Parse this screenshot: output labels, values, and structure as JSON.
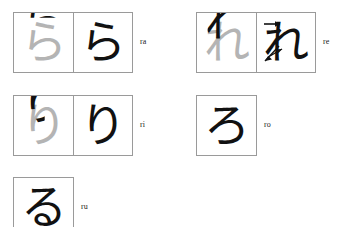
{
  "page": {
    "background_color": "#ffffff",
    "box_border_color": "#9a9a9a",
    "ink_color": "#111111",
    "ghost_color": "#b4b4b4",
    "label_color": "#222222"
  },
  "entries": [
    {
      "id": "ra",
      "romaji": "ra",
      "kana": "ら",
      "cells": [
        {
          "type": "trace",
          "kana": "ら",
          "has_arrows": false
        },
        {
          "type": "full",
          "kana": "ら",
          "has_arrows": false
        }
      ]
    },
    {
      "id": "re",
      "romaji": "re",
      "kana": "れ",
      "cells": [
        {
          "type": "trace",
          "kana": "れ",
          "has_arrows": false
        },
        {
          "type": "full",
          "kana": "れ",
          "has_arrows": true
        }
      ]
    },
    {
      "id": "ri",
      "romaji": "ri",
      "kana": "り",
      "cells": [
        {
          "type": "trace",
          "kana": "り",
          "has_arrows": false
        },
        {
          "type": "full",
          "kana": "り",
          "has_arrows": false
        }
      ]
    },
    {
      "id": "ro",
      "romaji": "ro",
      "kana": "ろ",
      "cells": [
        {
          "type": "full",
          "kana": "ろ",
          "has_arrows": false
        }
      ]
    },
    {
      "id": "ru",
      "romaji": "ru",
      "kana": "る",
      "cells": [
        {
          "type": "full",
          "kana": "る",
          "has_arrows": false
        }
      ]
    }
  ]
}
